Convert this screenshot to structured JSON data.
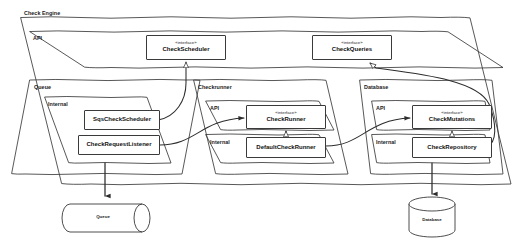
{
  "diagram": {
    "title": "Check Engine",
    "style": "uml-package-diagram",
    "stereotype_interface": "«interface»",
    "colors": {
      "stroke": "#3a3a3a",
      "text": "#111111",
      "background": "#ffffff"
    }
  },
  "root_package": {
    "label": "Check Engine"
  },
  "api_package": {
    "label": "API",
    "interfaces": [
      {
        "stereotype": "«interface»",
        "name": "CheckScheduler"
      },
      {
        "stereotype": "«interface»",
        "name": "CheckQueries"
      }
    ]
  },
  "packages": [
    {
      "label": "Queue",
      "subpackages": [
        {
          "label": "Internal",
          "classes": [
            {
              "name": "SqsCheckScheduler"
            },
            {
              "name": "CheckRequestListener"
            }
          ]
        }
      ]
    },
    {
      "label": "Checkrunner",
      "subpackages": [
        {
          "label": "API",
          "classes": [
            {
              "stereotype": "«interface»",
              "name": "CheckRunner"
            }
          ]
        },
        {
          "label": "Internal",
          "classes": [
            {
              "name": "DefaultCheckRunner"
            }
          ]
        }
      ]
    },
    {
      "label": "Database",
      "subpackages": [
        {
          "label": "API",
          "classes": [
            {
              "stereotype": "«interface»",
              "name": "CheckMutations"
            }
          ]
        },
        {
          "label": "Internal",
          "classes": [
            {
              "name": "CheckRepository"
            }
          ]
        }
      ]
    }
  ],
  "datastores": [
    {
      "name": "Queue",
      "shape": "cylinder-horizontal"
    },
    {
      "name": "Database",
      "shape": "cylinder-vertical"
    }
  ],
  "connections": [
    {
      "from": "SqsCheckScheduler",
      "to": "CheckScheduler",
      "type": "realization"
    },
    {
      "from": "CheckRepository",
      "to": "CheckQueries",
      "type": "realization"
    },
    {
      "from": "DefaultCheckRunner",
      "to": "CheckRunner",
      "type": "realization"
    },
    {
      "from": "CheckRepository",
      "to": "CheckMutations",
      "type": "realization"
    },
    {
      "from": "CheckRequestListener",
      "to": "CheckRunner",
      "type": "dependency"
    },
    {
      "from": "DefaultCheckRunner",
      "to": "CheckMutations",
      "type": "dependency"
    },
    {
      "from": "CheckRequestListener",
      "to": "Queue",
      "type": "dependency"
    },
    {
      "from": "CheckRepository",
      "to": "Database",
      "type": "dependency"
    }
  ]
}
